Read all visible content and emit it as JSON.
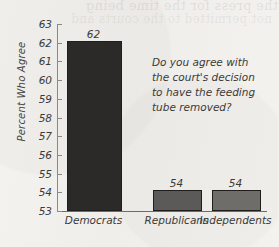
{
  "page": {
    "bleed_text_line1": "the press for the time being",
    "bleed_text_line2": "not permitted to the courts and"
  },
  "annotation": {
    "question": "Do you agree with the court's decision to have the feeding tube removed?"
  },
  "chart_data": {
    "type": "bar",
    "title": "",
    "xlabel": "",
    "ylabel": "Percent Who Agree",
    "categories": [
      "Democrats",
      "Republicans",
      "Independents"
    ],
    "values": [
      62,
      54,
      54
    ],
    "data_labels": [
      "62",
      "54",
      "54"
    ],
    "bar_colors": [
      "#2b2a29",
      "#5c5a58",
      "#6f6d6a"
    ],
    "ylim": [
      53,
      63
    ],
    "yticks": [
      53,
      54,
      55,
      56,
      57,
      58,
      59,
      60,
      61,
      62,
      63
    ],
    "ytick_labels": [
      "53",
      "54",
      "55",
      "56",
      "57",
      "58",
      "59",
      "60",
      "61",
      "62",
      "63"
    ],
    "grid": false,
    "legend": "none",
    "axis_color": "#8c8a86"
  }
}
